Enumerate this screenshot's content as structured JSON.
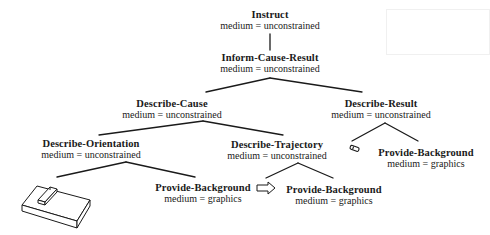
{
  "diagram": {
    "type": "tree",
    "nodes": [
      {
        "id": "instruct",
        "title": "Instruct",
        "medium": "medium = unconstrained"
      },
      {
        "id": "inform-cause-result",
        "title": "Inform-Cause-Result",
        "medium": "medium = unconstrained"
      },
      {
        "id": "describe-cause",
        "title": "Describe-Cause",
        "medium": "medium = unconstrained"
      },
      {
        "id": "describe-result",
        "title": "Describe-Result",
        "medium": "medium = unconstrained"
      },
      {
        "id": "describe-orientation",
        "title": "Describe-Orientation",
        "medium": "medium = unconstrained"
      },
      {
        "id": "describe-trajectory",
        "title": "Describe-Trajectory",
        "medium": "medium = unconstrained"
      },
      {
        "id": "provide-background-result",
        "title": "Provide-Background",
        "medium": "medium = graphics"
      },
      {
        "id": "provide-background-orientation",
        "title": "Provide-Background",
        "medium": "medium = graphics"
      },
      {
        "id": "provide-background-trajectory",
        "title": "Provide-Background",
        "medium": "medium = graphics"
      }
    ],
    "edges": [
      [
        "instruct",
        "inform-cause-result"
      ],
      [
        "inform-cause-result",
        "describe-cause"
      ],
      [
        "inform-cause-result",
        "describe-result"
      ],
      [
        "describe-cause",
        "describe-orientation"
      ],
      [
        "describe-cause",
        "describe-trajectory"
      ],
      [
        "describe-result",
        "small-object-icon"
      ],
      [
        "describe-result",
        "provide-background-result"
      ],
      [
        "describe-orientation",
        "device-illustration"
      ],
      [
        "describe-orientation",
        "provide-background-orientation"
      ],
      [
        "describe-trajectory",
        "arrow-icon"
      ],
      [
        "describe-trajectory",
        "provide-background-trajectory"
      ]
    ],
    "icons": {
      "device_illustration": "3d-box-device-icon",
      "small_object": "small-object-icon",
      "arrow": "right-arrow-icon"
    },
    "line_color": "#1a1a1a"
  }
}
